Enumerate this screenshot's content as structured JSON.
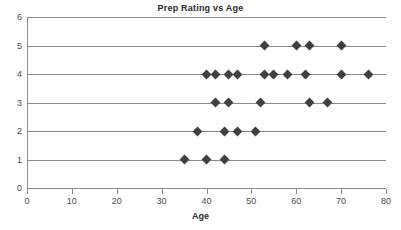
{
  "chart_data": {
    "type": "scatter",
    "title": "Prep Rating vs Age",
    "xlabel": "Age",
    "ylabel": "",
    "xlim": [
      0,
      80
    ],
    "ylim": [
      0,
      6
    ],
    "xticks": [
      0,
      10,
      20,
      30,
      40,
      50,
      60,
      70,
      80
    ],
    "yticks": [
      0,
      1,
      2,
      3,
      4,
      5,
      6
    ],
    "grid": "horizontal",
    "legend": "none",
    "marker": "diamond",
    "marker_color": "#404040",
    "points": [
      {
        "x": 35,
        "y": 1
      },
      {
        "x": 40,
        "y": 1
      },
      {
        "x": 44,
        "y": 1
      },
      {
        "x": 38,
        "y": 2
      },
      {
        "x": 44,
        "y": 2
      },
      {
        "x": 47,
        "y": 2
      },
      {
        "x": 51,
        "y": 2
      },
      {
        "x": 42,
        "y": 3
      },
      {
        "x": 45,
        "y": 3
      },
      {
        "x": 52,
        "y": 3
      },
      {
        "x": 63,
        "y": 3
      },
      {
        "x": 67,
        "y": 3
      },
      {
        "x": 40,
        "y": 4
      },
      {
        "x": 42,
        "y": 4
      },
      {
        "x": 45,
        "y": 4
      },
      {
        "x": 47,
        "y": 4
      },
      {
        "x": 53,
        "y": 4
      },
      {
        "x": 55,
        "y": 4
      },
      {
        "x": 58,
        "y": 4
      },
      {
        "x": 62,
        "y": 4
      },
      {
        "x": 70,
        "y": 4
      },
      {
        "x": 76,
        "y": 4
      },
      {
        "x": 53,
        "y": 5
      },
      {
        "x": 60,
        "y": 5
      },
      {
        "x": 63,
        "y": 5
      },
      {
        "x": 70,
        "y": 5
      }
    ]
  },
  "axis": {
    "x_tick_labels": [
      "0",
      "10",
      "20",
      "30",
      "40",
      "50",
      "60",
      "70",
      "80"
    ],
    "y_tick_labels": [
      "0",
      "1",
      "2",
      "3",
      "4",
      "5",
      "6"
    ]
  }
}
